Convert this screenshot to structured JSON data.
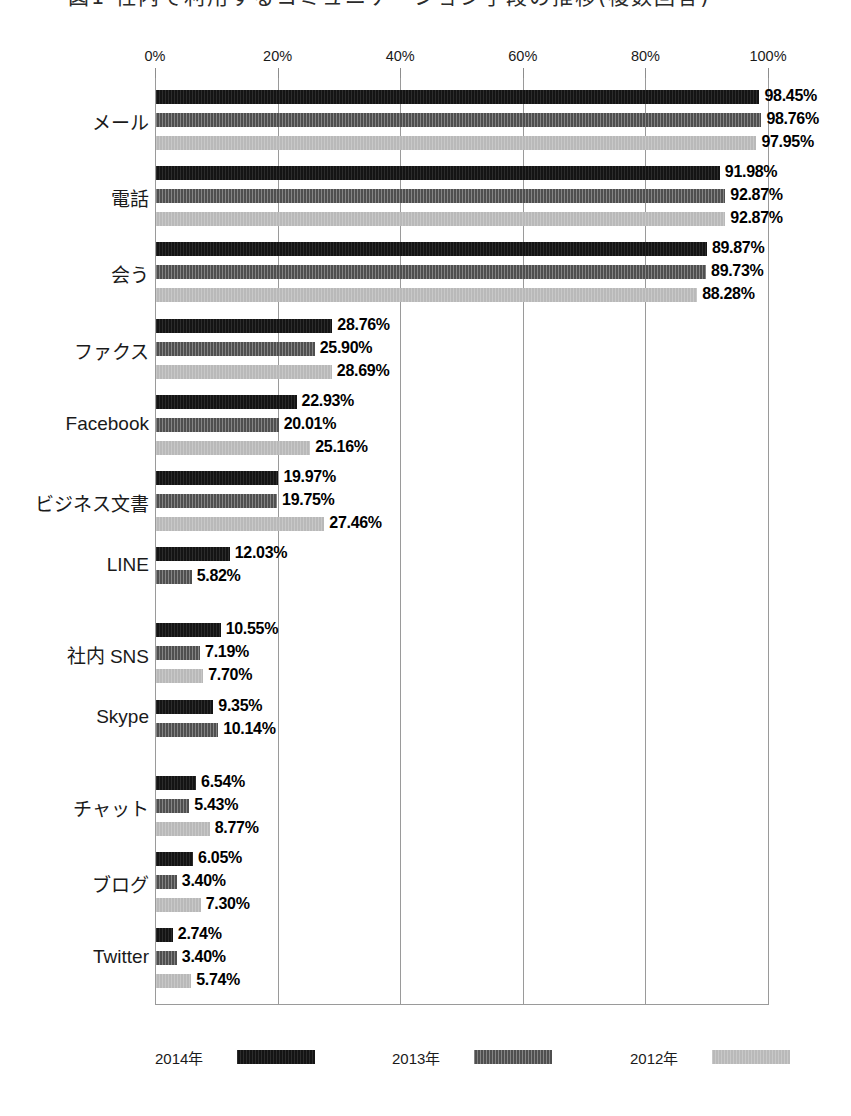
{
  "title": "図1 社内で利用するコミュニケーション手段の推移(複数回答)",
  "legend": {
    "position": "bottom",
    "entries": [
      {
        "label": "2014年",
        "key": "y2014",
        "color": "#141414"
      },
      {
        "label": "2013年",
        "key": "y2013",
        "color": "#4f4f4f"
      },
      {
        "label": "2012年",
        "key": "y2012",
        "color": "#b9b9b9"
      }
    ]
  },
  "axis": {
    "ticks": [
      "0%",
      "20%",
      "40%",
      "60%",
      "80%",
      "100%"
    ],
    "tick_values": [
      0,
      20,
      40,
      60,
      80,
      100
    ],
    "position": "top"
  },
  "chart_data": {
    "type": "bar",
    "orientation": "horizontal",
    "title": "図1 社内で利用するコミュニケーション手段の推移(複数回答)",
    "xlabel": "",
    "ylabel": "",
    "xlim": [
      0,
      100
    ],
    "grid": true,
    "legend_position": "bottom",
    "categories": [
      "メール",
      "電話",
      "会う",
      "ファクス",
      "Facebook",
      "ビジネス文書",
      "LINE",
      "社内 SNS",
      "Skype",
      "チャット",
      "ブログ",
      "Twitter"
    ],
    "series": [
      {
        "name": "2014年",
        "color": "#141414",
        "values": [
          98.45,
          91.98,
          89.87,
          28.76,
          22.93,
          19.97,
          12.03,
          10.55,
          9.35,
          6.54,
          6.05,
          2.74
        ],
        "labels": [
          "98.45%",
          "91.98%",
          "89.87%",
          "28.76%",
          "22.93%",
          "19.97%",
          "12.03%",
          "10.55%",
          "9.35%",
          "6.54%",
          "6.05%",
          "2.74%"
        ]
      },
      {
        "name": "2013年",
        "color": "#4f4f4f",
        "values": [
          98.76,
          92.87,
          89.73,
          25.9,
          20.01,
          19.75,
          5.82,
          7.19,
          10.14,
          5.43,
          3.4,
          3.4
        ],
        "labels": [
          "98.76%",
          "92.87%",
          "89.73%",
          "25.90%",
          "20.01%",
          "19.75%",
          "5.82%",
          "7.19%",
          "10.14%",
          "5.43%",
          "3.40%",
          "3.40%"
        ]
      },
      {
        "name": "2012年",
        "color": "#b9b9b9",
        "values": [
          97.95,
          92.87,
          88.28,
          28.69,
          25.16,
          27.46,
          null,
          7.7,
          null,
          8.77,
          7.3,
          5.74
        ],
        "labels": [
          "97.95%",
          "92.87%",
          "88.28%",
          "28.69%",
          "25.16%",
          "27.46%",
          null,
          "7.70%",
          null,
          "8.77%",
          "7.30%",
          "5.74%"
        ]
      }
    ]
  }
}
